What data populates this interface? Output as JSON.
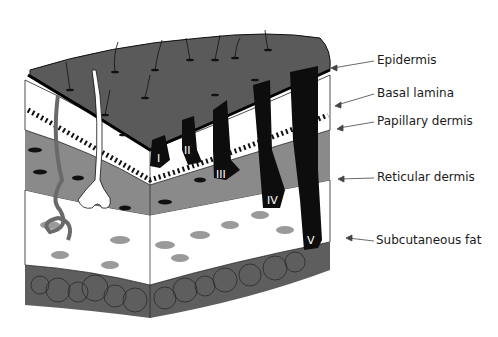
{
  "diagram": {
    "type": "skin cross-section",
    "layers": [
      {
        "id": "epidermis",
        "label": "Epidermis"
      },
      {
        "id": "basal_lamina",
        "label": "Basal lamina"
      },
      {
        "id": "papillary_dermis",
        "label": "Papillary dermis"
      },
      {
        "id": "reticular_dermis",
        "label": "Reticular dermis"
      },
      {
        "id": "subcutaneous_fat",
        "label": "Subcutaneous fat"
      }
    ],
    "levels": [
      "I",
      "II",
      "III",
      "IV",
      "V"
    ],
    "colors": {
      "epidermis": "#5a5a5a",
      "papillary": "#8a8a8a",
      "reticular": "#ffffff",
      "fat": "#5e5e5e",
      "tumor": "#0d0d0d",
      "collagen_patch": "#9a9a9a"
    }
  }
}
